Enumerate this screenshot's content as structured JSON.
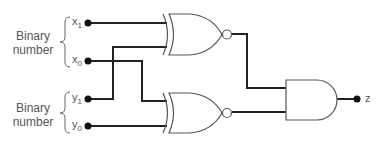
{
  "groups": [
    {
      "label_line1": "Binary",
      "label_line2": "number",
      "inputs": [
        "x1",
        "x0"
      ]
    },
    {
      "label_line1": "Binary",
      "label_line2": "number",
      "inputs": [
        "y1",
        "y0"
      ]
    }
  ],
  "inputs": [
    {
      "name": "x",
      "sub": "1"
    },
    {
      "name": "x",
      "sub": "0"
    },
    {
      "name": "y",
      "sub": "1"
    },
    {
      "name": "y",
      "sub": "0"
    }
  ],
  "gates": [
    {
      "type": "XNOR",
      "inputs": [
        "x1",
        "y1"
      ]
    },
    {
      "type": "XNOR",
      "inputs": [
        "x0",
        "y0"
      ]
    },
    {
      "type": "AND",
      "inputs": [
        "XNOR1",
        "XNOR2"
      ],
      "output": "z"
    }
  ],
  "output": {
    "name": "z"
  },
  "colors": {
    "wire": "#222222",
    "gate": "#555555",
    "text": "#555555"
  }
}
